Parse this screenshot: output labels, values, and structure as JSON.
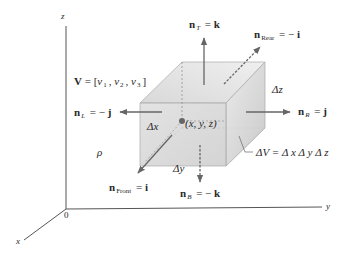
{
  "figure": {
    "axes": {
      "z_label": "z",
      "y_label": "y",
      "x_label": "x",
      "origin_label": "0"
    },
    "velocity": {
      "lhs": "V",
      "eq": " = [",
      "v1": "v",
      "v1_sub": "1",
      "sep1": ", ",
      "v2": "v",
      "v2_sub": "2",
      "sep2": ", ",
      "v3": "v",
      "v3_sub": "3",
      "close": "]"
    },
    "density_label": "ρ",
    "normals": {
      "top": {
        "n": "n",
        "sub": "T",
        "eq": " = ",
        "sign": "",
        "vec": "k"
      },
      "rear": {
        "n": "n",
        "sub": "Rear",
        "eq": " = − ",
        "vec": "i"
      },
      "left": {
        "n": "n",
        "sub": "L",
        "eq": " = − ",
        "vec": "j"
      },
      "right": {
        "n": "n",
        "sub": "R",
        "eq": " = ",
        "vec": "j"
      },
      "front": {
        "n": "n",
        "sub": "Front",
        "eq": " = ",
        "vec": "i"
      },
      "bottom": {
        "n": "n",
        "sub": "B",
        "eq": " = − ",
        "vec": "k"
      }
    },
    "dimensions": {
      "dx": "Δx",
      "dy": "Δy",
      "dz": "Δz"
    },
    "point_label": "(x, y, z)",
    "volume_label": "ΔV = Δ x Δ y Δ z",
    "colors": {
      "line": "#555555",
      "arrow": "#666666",
      "box_front": "#d6d6d6",
      "box_top": "#e6e6e6",
      "box_side": "#c8c8c8",
      "point": "#666666"
    }
  }
}
